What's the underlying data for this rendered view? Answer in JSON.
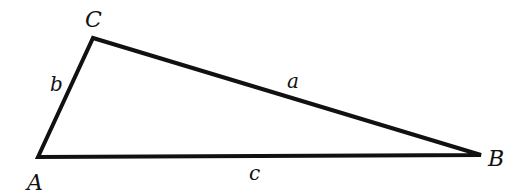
{
  "diagram": {
    "type": "triangle",
    "stroke_color": "#111111",
    "background": "#ffffff",
    "vertices": {
      "A": {
        "label": "A",
        "x": 38,
        "y": 157
      },
      "B": {
        "label": "B",
        "x": 481,
        "y": 155
      },
      "C": {
        "label": "C",
        "x": 93,
        "y": 38
      }
    },
    "sides": {
      "a": {
        "label": "a",
        "from": "C",
        "to": "B"
      },
      "b": {
        "label": "b",
        "from": "A",
        "to": "C"
      },
      "c": {
        "label": "c",
        "from": "A",
        "to": "B"
      }
    }
  }
}
